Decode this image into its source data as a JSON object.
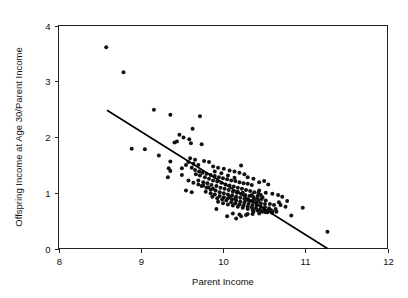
{
  "chart_data": {
    "type": "scatter",
    "title": "",
    "xlabel": "Parent Income",
    "ylabel": "Offspring Income at Age 30/Parent Income",
    "xlim": [
      8,
      12
    ],
    "ylim": [
      0,
      4
    ],
    "xticks": [
      8,
      9,
      10,
      11,
      12
    ],
    "yticks": [
      0,
      1,
      2,
      3,
      4
    ],
    "xtick_labels": [
      "8",
      "9",
      "10",
      "11",
      "12"
    ],
    "ytick_labels": [
      "0",
      "1",
      "2",
      "3",
      "4"
    ],
    "grid": false,
    "legend": null,
    "legend_position": "none",
    "marker": "filled-circle",
    "marker_color": "#111111",
    "marker_size_px": 4,
    "fit_line": {
      "label": "linear fit",
      "color": "#000000",
      "x_start": 8.59,
      "y_start": 2.48,
      "x_end": 11.27,
      "y_end": 0.0,
      "slope": -0.925,
      "intercept": 10.43
    },
    "annotations": [],
    "points": [
      [
        8.58,
        3.61
      ],
      [
        8.79,
        3.16
      ],
      [
        9.16,
        2.49
      ],
      [
        9.36,
        2.4
      ],
      [
        9.72,
        2.37
      ],
      [
        9.63,
        2.15
      ],
      [
        8.89,
        1.79
      ],
      [
        9.05,
        1.78
      ],
      [
        9.22,
        1.67
      ],
      [
        9.47,
        2.04
      ],
      [
        9.52,
        1.99
      ],
      [
        9.59,
        1.96
      ],
      [
        9.44,
        1.92
      ],
      [
        9.41,
        1.9
      ],
      [
        9.61,
        1.89
      ],
      [
        9.74,
        1.87
      ],
      [
        9.36,
        1.56
      ],
      [
        9.34,
        1.44
      ],
      [
        9.36,
        1.39
      ],
      [
        9.33,
        1.28
      ],
      [
        9.5,
        1.32
      ],
      [
        9.58,
        1.55
      ],
      [
        9.64,
        1.52
      ],
      [
        9.7,
        1.5
      ],
      [
        9.77,
        1.57
      ],
      [
        9.83,
        1.55
      ],
      [
        9.88,
        1.47
      ],
      [
        9.94,
        1.45
      ],
      [
        10.01,
        1.43
      ],
      [
        10.08,
        1.4
      ],
      [
        10.14,
        1.38
      ],
      [
        10.2,
        1.36
      ],
      [
        10.26,
        1.33
      ],
      [
        9.62,
        1.45
      ],
      [
        9.66,
        1.41
      ],
      [
        9.71,
        1.38
      ],
      [
        9.75,
        1.36
      ],
      [
        9.8,
        1.34
      ],
      [
        9.85,
        1.32
      ],
      [
        9.9,
        1.3
      ],
      [
        9.95,
        1.28
      ],
      [
        10.0,
        1.26
      ],
      [
        10.05,
        1.24
      ],
      [
        10.1,
        1.22
      ],
      [
        10.15,
        1.21
      ],
      [
        10.2,
        1.19
      ],
      [
        10.25,
        1.17
      ],
      [
        10.3,
        1.16
      ],
      [
        10.35,
        1.14
      ],
      [
        9.67,
        1.33
      ],
      [
        9.72,
        1.31
      ],
      [
        9.78,
        1.28
      ],
      [
        9.83,
        1.25
      ],
      [
        9.88,
        1.22
      ],
      [
        9.93,
        1.2
      ],
      [
        9.98,
        1.18
      ],
      [
        10.03,
        1.15
      ],
      [
        10.08,
        1.13
      ],
      [
        10.13,
        1.11
      ],
      [
        10.18,
        1.09
      ],
      [
        10.23,
        1.07
      ],
      [
        10.28,
        1.05
      ],
      [
        10.33,
        1.03
      ],
      [
        10.38,
        1.01
      ],
      [
        10.43,
        1.0
      ],
      [
        9.7,
        1.22
      ],
      [
        9.76,
        1.19
      ],
      [
        9.81,
        1.17
      ],
      [
        9.86,
        1.14
      ],
      [
        9.92,
        1.12
      ],
      [
        9.97,
        1.09
      ],
      [
        10.02,
        1.07
      ],
      [
        10.07,
        1.05
      ],
      [
        10.12,
        1.02
      ],
      [
        10.17,
        1.0
      ],
      [
        10.22,
        0.98
      ],
      [
        10.27,
        0.96
      ],
      [
        10.32,
        0.94
      ],
      [
        10.37,
        0.92
      ],
      [
        10.42,
        0.9
      ],
      [
        10.47,
        0.89
      ],
      [
        9.74,
        1.12
      ],
      [
        9.8,
        1.09
      ],
      [
        9.85,
        1.06
      ],
      [
        9.91,
        1.04
      ],
      [
        9.96,
        1.01
      ],
      [
        10.01,
        0.99
      ],
      [
        10.06,
        0.97
      ],
      [
        10.11,
        0.95
      ],
      [
        10.16,
        0.93
      ],
      [
        10.21,
        0.91
      ],
      [
        10.26,
        0.89
      ],
      [
        10.31,
        0.87
      ],
      [
        10.36,
        0.85
      ],
      [
        10.41,
        0.83
      ],
      [
        10.46,
        0.81
      ],
      [
        10.51,
        0.8
      ],
      [
        9.79,
        1.02
      ],
      [
        9.85,
        0.99
      ],
      [
        9.9,
        0.97
      ],
      [
        9.96,
        0.94
      ],
      [
        10.01,
        0.92
      ],
      [
        10.06,
        0.9
      ],
      [
        10.11,
        0.88
      ],
      [
        10.16,
        0.86
      ],
      [
        10.21,
        0.84
      ],
      [
        10.26,
        0.82
      ],
      [
        10.31,
        0.8
      ],
      [
        10.36,
        0.78
      ],
      [
        10.41,
        0.77
      ],
      [
        10.46,
        0.75
      ],
      [
        10.51,
        0.74
      ],
      [
        10.56,
        0.72
      ],
      [
        9.87,
        0.93
      ],
      [
        9.93,
        0.9
      ],
      [
        9.99,
        0.88
      ],
      [
        10.04,
        0.86
      ],
      [
        10.1,
        0.83
      ],
      [
        10.15,
        0.81
      ],
      [
        10.2,
        0.79
      ],
      [
        10.25,
        0.77
      ],
      [
        10.3,
        0.75
      ],
      [
        10.35,
        0.74
      ],
      [
        10.4,
        0.72
      ],
      [
        10.45,
        0.7
      ],
      [
        10.5,
        0.69
      ],
      [
        10.55,
        0.68
      ],
      [
        10.6,
        0.67
      ],
      [
        10.65,
        0.66
      ],
      [
        9.94,
        0.84
      ],
      [
        10.0,
        0.81
      ],
      [
        10.06,
        0.79
      ],
      [
        10.12,
        0.77
      ],
      [
        10.18,
        0.75
      ],
      [
        10.24,
        0.73
      ],
      [
        10.3,
        0.71
      ],
      [
        10.36,
        0.69
      ],
      [
        10.42,
        0.68
      ],
      [
        10.48,
        0.66
      ],
      [
        10.54,
        0.65
      ],
      [
        10.6,
        0.64
      ],
      [
        10.12,
        0.63
      ],
      [
        10.2,
        0.61
      ],
      [
        10.28,
        0.6
      ],
      [
        10.36,
        0.62
      ],
      [
        10.44,
        0.63
      ],
      [
        10.52,
        0.65
      ],
      [
        10.58,
        0.69
      ],
      [
        10.64,
        0.71
      ],
      [
        9.92,
        0.71
      ],
      [
        10.05,
        0.58
      ],
      [
        10.16,
        0.54
      ],
      [
        10.22,
        0.58
      ],
      [
        10.3,
        0.62
      ],
      [
        10.37,
        0.66
      ],
      [
        10.45,
        0.68
      ],
      [
        10.22,
        1.49
      ],
      [
        10.3,
        1.28
      ],
      [
        10.37,
        1.25
      ],
      [
        10.44,
        1.19
      ],
      [
        10.5,
        1.21
      ],
      [
        10.55,
        1.15
      ],
      [
        10.44,
        1.04
      ],
      [
        10.52,
        1.0
      ],
      [
        10.6,
        0.98
      ],
      [
        10.67,
        0.96
      ],
      [
        10.72,
        0.93
      ],
      [
        10.78,
        0.85
      ],
      [
        10.7,
        0.78
      ],
      [
        10.76,
        0.75
      ],
      [
        10.83,
        0.59
      ],
      [
        10.97,
        0.73
      ],
      [
        11.27,
        0.3
      ],
      [
        9.6,
        1.62
      ],
      [
        9.66,
        1.59
      ],
      [
        9.55,
        1.5
      ],
      [
        9.5,
        1.44
      ],
      [
        9.9,
        1.38
      ],
      [
        9.98,
        1.35
      ],
      [
        10.06,
        1.31
      ],
      [
        10.14,
        1.27
      ],
      [
        9.58,
        1.22
      ],
      [
        9.64,
        1.18
      ],
      [
        9.7,
        1.15
      ],
      [
        9.76,
        1.13
      ],
      [
        9.82,
        1.1
      ],
      [
        9.88,
        1.07
      ],
      [
        9.55,
        1.04
      ],
      [
        9.62,
        1.01
      ],
      [
        10.18,
        1.02
      ],
      [
        10.24,
        1.0
      ],
      [
        10.08,
        0.92
      ],
      [
        10.15,
        0.9
      ],
      [
        10.35,
        0.96
      ],
      [
        10.42,
        0.94
      ],
      [
        10.48,
        0.92
      ],
      [
        10.28,
        0.87
      ],
      [
        10.33,
        0.85
      ],
      [
        10.38,
        0.88
      ],
      [
        10.43,
        0.86
      ],
      [
        10.46,
        0.96
      ],
      [
        10.52,
        0.86
      ],
      [
        10.57,
        0.8
      ],
      [
        10.62,
        0.78
      ],
      [
        10.68,
        0.83
      ]
    ]
  },
  "axes": {
    "x_axis_name": "x-axis",
    "y_axis_name": "y-axis"
  }
}
